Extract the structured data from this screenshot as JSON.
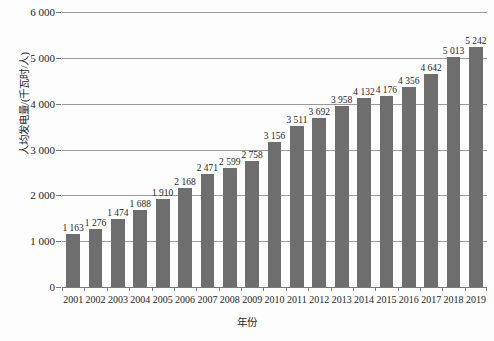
{
  "chart_data": {
    "type": "bar",
    "title": "",
    "subtitle": "",
    "xlabel": "年份",
    "ylabel": "人均发电量/(千瓦时/人)",
    "categories": [
      "2001",
      "2002",
      "2003",
      "2004",
      "2005",
      "2006",
      "2007",
      "2008",
      "2009",
      "2010",
      "2011",
      "2012",
      "2013",
      "2014",
      "2015",
      "2016",
      "2017",
      "2018",
      "2019"
    ],
    "values": [
      1163,
      1276,
      1474,
      1688,
      1910,
      2168,
      2471,
      2599,
      2758,
      3156,
      3511,
      3692,
      3958,
      4132,
      4176,
      4356,
      4642,
      5013,
      5242
    ],
    "value_labels": [
      "1 163",
      "1 276",
      "1 474",
      "1 688",
      "1 910",
      "2 168",
      "2 471",
      "2 599",
      "2 758",
      "3 156",
      "3 511",
      "3 692",
      "3 958",
      "4 132",
      "4 176",
      "4 356",
      "4 642",
      "5 013",
      "5 242"
    ],
    "ylim": [
      0,
      6000
    ],
    "y_ticks": [
      0,
      1000,
      2000,
      3000,
      4000,
      5000,
      6000
    ],
    "y_tick_labels": [
      "0",
      "1 000",
      "2 000",
      "3 000",
      "4 000",
      "5 000",
      "6 000"
    ],
    "grid": true,
    "legend": "none",
    "series": [
      {
        "name": "人均发电量",
        "values": [
          1163,
          1276,
          1474,
          1688,
          1910,
          2168,
          2471,
          2599,
          2758,
          3156,
          3511,
          3692,
          3958,
          4132,
          4176,
          4356,
          4642,
          5013,
          5242
        ]
      }
    ],
    "colors": {
      "bar": "#6e6e6e",
      "gridline": "#9b9b9b",
      "axis": "#7a7a7a",
      "text": "#1f1f1f",
      "background": "#fdfdfd"
    }
  }
}
